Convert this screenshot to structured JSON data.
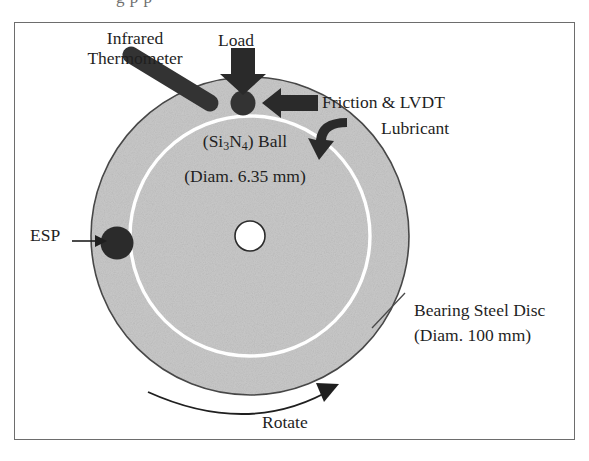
{
  "figure": {
    "type": "apparatus-schematic",
    "scan_top_fragment": "g p p",
    "frame": {
      "x": 14,
      "y": 22,
      "width": 561,
      "height": 418,
      "border_color": "#6d6d6d"
    },
    "colors": {
      "disc_fill": "#c9c9c9",
      "disc_edge": "#4a4a4a",
      "wear_track": "#ffffff",
      "component_dark": "#262626",
      "text": "#1f1f1f",
      "background": "#ffffff"
    },
    "disc": {
      "name": "Bearing Steel Disc",
      "center_x": 250,
      "center_y": 236,
      "radius": 159,
      "hole_radius": 15,
      "wear_track_radius": 120
    },
    "labels": {
      "infrared_thermometer_line1": "Infrared",
      "infrared_thermometer_line2": "Thermometer",
      "load": "Load",
      "friction_lvdt": "Friction & LVDT",
      "lubricant": "Lubricant",
      "ball_name": "Ball",
      "ball_formula_si": "Si",
      "ball_formula_sub3": "3",
      "ball_formula_n": "N",
      "ball_formula_sub4": "4",
      "ball_diameter": "(Diam. 6.35 mm)",
      "esp": "ESP",
      "disc_name": "Bearing Steel Disc",
      "disc_diameter": "(Diam. 100 mm)",
      "rotate": "Rotate"
    },
    "components": [
      {
        "name": "silicon-nitride-ball",
        "shape": "filled-circle",
        "x": 243,
        "y": 103,
        "r": 12
      },
      {
        "name": "esp-sensor",
        "shape": "filled-circle",
        "x": 117,
        "y": 243,
        "r": 16
      },
      {
        "name": "infrared-thermometer-probe",
        "shape": "rod",
        "x1": 128,
        "y1": 52,
        "x2": 213,
        "y2": 104,
        "width": 16
      },
      {
        "name": "load-arrow",
        "shape": "block-arrow-down",
        "x": 243,
        "y": 46
      },
      {
        "name": "friction-lvdt-arrow",
        "shape": "block-arrow-left",
        "x": 273,
        "y": 103
      },
      {
        "name": "lubricant-arrow",
        "shape": "hook-arrow",
        "x": 330,
        "y": 140
      },
      {
        "name": "rotate-arrow",
        "shape": "curved-arrow-right",
        "cx": 250,
        "cy": 236,
        "r": 175
      }
    ]
  }
}
